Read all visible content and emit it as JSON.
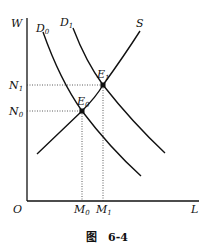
{
  "figure": {
    "caption_prefix": "图",
    "caption_number": "6-4",
    "axes": {
      "y_label": "W",
      "x_label": "L",
      "origin_label": "O"
    },
    "curves": [
      {
        "id": "D0",
        "name": "D",
        "sub": "0",
        "type": "demand"
      },
      {
        "id": "D1",
        "name": "D",
        "sub": "1",
        "type": "demand"
      },
      {
        "id": "S",
        "name": "S",
        "sub": "",
        "type": "supply"
      }
    ],
    "points": [
      {
        "id": "E0",
        "name": "E",
        "sub": "0"
      },
      {
        "id": "E1",
        "name": "E",
        "sub": "1"
      }
    ],
    "y_ticks": [
      {
        "name": "N",
        "sub": "1"
      },
      {
        "name": "N",
        "sub": "0"
      }
    ],
    "x_ticks": [
      {
        "name": "M",
        "sub": "0"
      },
      {
        "name": "M",
        "sub": "1"
      }
    ],
    "colors": {
      "line": "#111111",
      "background": "#ffffff"
    }
  }
}
